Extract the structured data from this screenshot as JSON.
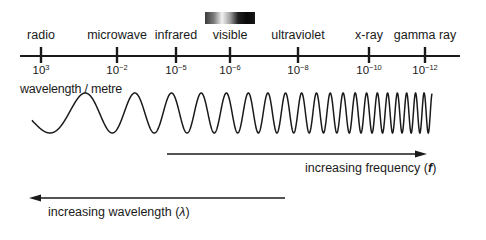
{
  "bands": [
    {
      "label": "radio",
      "x": 41,
      "exponent": "3"
    },
    {
      "label": "microwave",
      "x": 117,
      "exponent": "−2"
    },
    {
      "label": "infrared",
      "x": 176,
      "exponent": "−5"
    },
    {
      "label": "visible",
      "x": 230,
      "exponent": "−6"
    },
    {
      "label": "ultraviolet",
      "x": 298,
      "exponent": "−8"
    },
    {
      "label": "x-ray",
      "x": 369,
      "exponent": "−10"
    },
    {
      "label": "gamma ray",
      "x": 425,
      "exponent": "−12"
    }
  ],
  "tick_base": "10",
  "axis_label": "wavelength / metre",
  "visible_spectrum_bar": {
    "colors": [
      "#3a3a3a",
      "#8a8a8a",
      "#f0f0f0",
      "#9a9a9a",
      "#1c1c1c",
      "#080808",
      "#161616"
    ]
  },
  "frequency_arrow": {
    "label": "increasing frequency (",
    "symbol": "f",
    "close": ")"
  },
  "wavelength_arrow": {
    "label": "increasing wavelength (",
    "symbol": "λ",
    "close": ")"
  },
  "colors": {
    "ink": "#1a1a1a",
    "background": "#ffffff"
  }
}
